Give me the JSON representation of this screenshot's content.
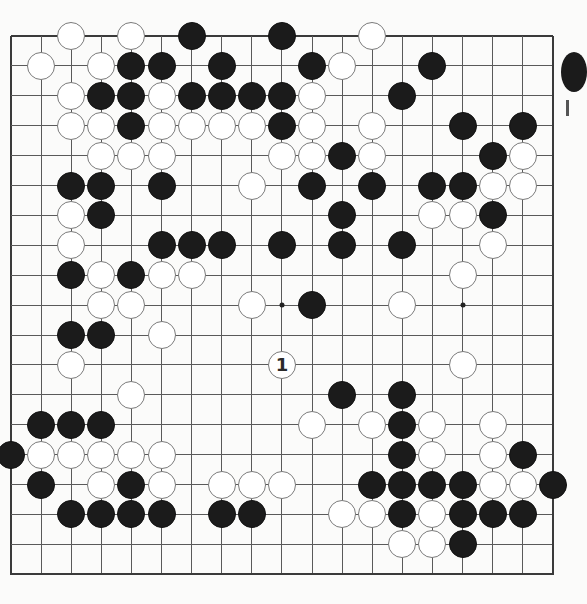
{
  "board": {
    "size": 19,
    "origin_x": 11,
    "origin_y": 36,
    "step_x": 30.1,
    "step_y": 29.9,
    "colors": {
      "background": "#fbfbfa",
      "grid_line": "#5a5a5a",
      "edge_line": "#3a3a3a",
      "black_stone": "#1b1b1b",
      "white_stone": "#ffffff",
      "white_outline": "#7a7a7a"
    },
    "star_points": [
      {
        "col": 9,
        "row": 9
      },
      {
        "col": 15,
        "row": 9
      }
    ],
    "stones": [
      {
        "col": 2,
        "row": 0,
        "color": "white"
      },
      {
        "col": 4,
        "row": 0,
        "color": "white"
      },
      {
        "col": 6,
        "row": 0,
        "color": "black"
      },
      {
        "col": 9,
        "row": 0,
        "color": "black"
      },
      {
        "col": 12,
        "row": 0,
        "color": "white"
      },
      {
        "col": 1,
        "row": 1,
        "color": "white"
      },
      {
        "col": 3,
        "row": 1,
        "color": "white"
      },
      {
        "col": 4,
        "row": 1,
        "color": "black"
      },
      {
        "col": 5,
        "row": 1,
        "color": "black"
      },
      {
        "col": 7,
        "row": 1,
        "color": "black"
      },
      {
        "col": 10,
        "row": 1,
        "color": "black"
      },
      {
        "col": 11,
        "row": 1,
        "color": "white"
      },
      {
        "col": 14,
        "row": 1,
        "color": "black"
      },
      {
        "col": 2,
        "row": 2,
        "color": "white"
      },
      {
        "col": 3,
        "row": 2,
        "color": "black"
      },
      {
        "col": 4,
        "row": 2,
        "color": "black"
      },
      {
        "col": 5,
        "row": 2,
        "color": "white"
      },
      {
        "col": 6,
        "row": 2,
        "color": "black"
      },
      {
        "col": 7,
        "row": 2,
        "color": "black"
      },
      {
        "col": 8,
        "row": 2,
        "color": "black"
      },
      {
        "col": 9,
        "row": 2,
        "color": "black"
      },
      {
        "col": 10,
        "row": 2,
        "color": "white"
      },
      {
        "col": 13,
        "row": 2,
        "color": "black"
      },
      {
        "col": 2,
        "row": 3,
        "color": "white"
      },
      {
        "col": 3,
        "row": 3,
        "color": "white"
      },
      {
        "col": 4,
        "row": 3,
        "color": "black"
      },
      {
        "col": 5,
        "row": 3,
        "color": "white"
      },
      {
        "col": 6,
        "row": 3,
        "color": "white"
      },
      {
        "col": 7,
        "row": 3,
        "color": "white"
      },
      {
        "col": 8,
        "row": 3,
        "color": "white"
      },
      {
        "col": 9,
        "row": 3,
        "color": "black"
      },
      {
        "col": 10,
        "row": 3,
        "color": "white"
      },
      {
        "col": 12,
        "row": 3,
        "color": "white"
      },
      {
        "col": 15,
        "row": 3,
        "color": "black"
      },
      {
        "col": 17,
        "row": 3,
        "color": "black"
      },
      {
        "col": 3,
        "row": 4,
        "color": "white"
      },
      {
        "col": 4,
        "row": 4,
        "color": "white"
      },
      {
        "col": 5,
        "row": 4,
        "color": "white"
      },
      {
        "col": 9,
        "row": 4,
        "color": "white"
      },
      {
        "col": 10,
        "row": 4,
        "color": "white"
      },
      {
        "col": 11,
        "row": 4,
        "color": "black"
      },
      {
        "col": 12,
        "row": 4,
        "color": "white"
      },
      {
        "col": 16,
        "row": 4,
        "color": "black"
      },
      {
        "col": 17,
        "row": 4,
        "color": "white"
      },
      {
        "col": 2,
        "row": 5,
        "color": "black"
      },
      {
        "col": 3,
        "row": 5,
        "color": "black"
      },
      {
        "col": 5,
        "row": 5,
        "color": "black"
      },
      {
        "col": 8,
        "row": 5,
        "color": "white"
      },
      {
        "col": 10,
        "row": 5,
        "color": "black"
      },
      {
        "col": 12,
        "row": 5,
        "color": "black"
      },
      {
        "col": 14,
        "row": 5,
        "color": "black"
      },
      {
        "col": 15,
        "row": 5,
        "color": "black"
      },
      {
        "col": 16,
        "row": 5,
        "color": "white"
      },
      {
        "col": 17,
        "row": 5,
        "color": "white"
      },
      {
        "col": 2,
        "row": 6,
        "color": "white"
      },
      {
        "col": 3,
        "row": 6,
        "color": "black"
      },
      {
        "col": 11,
        "row": 6,
        "color": "black"
      },
      {
        "col": 14,
        "row": 6,
        "color": "white"
      },
      {
        "col": 15,
        "row": 6,
        "color": "white"
      },
      {
        "col": 16,
        "row": 6,
        "color": "black"
      },
      {
        "col": 2,
        "row": 7,
        "color": "white"
      },
      {
        "col": 5,
        "row": 7,
        "color": "black"
      },
      {
        "col": 6,
        "row": 7,
        "color": "black"
      },
      {
        "col": 7,
        "row": 7,
        "color": "black"
      },
      {
        "col": 9,
        "row": 7,
        "color": "black"
      },
      {
        "col": 11,
        "row": 7,
        "color": "black"
      },
      {
        "col": 13,
        "row": 7,
        "color": "black"
      },
      {
        "col": 16,
        "row": 7,
        "color": "white"
      },
      {
        "col": 2,
        "row": 8,
        "color": "black"
      },
      {
        "col": 3,
        "row": 8,
        "color": "white"
      },
      {
        "col": 4,
        "row": 8,
        "color": "black"
      },
      {
        "col": 5,
        "row": 8,
        "color": "white"
      },
      {
        "col": 6,
        "row": 8,
        "color": "white"
      },
      {
        "col": 15,
        "row": 8,
        "color": "white"
      },
      {
        "col": 3,
        "row": 9,
        "color": "white"
      },
      {
        "col": 4,
        "row": 9,
        "color": "white"
      },
      {
        "col": 8,
        "row": 9,
        "color": "white"
      },
      {
        "col": 10,
        "row": 9,
        "color": "black"
      },
      {
        "col": 13,
        "row": 9,
        "color": "white"
      },
      {
        "col": 2,
        "row": 10,
        "color": "black"
      },
      {
        "col": 3,
        "row": 10,
        "color": "black"
      },
      {
        "col": 5,
        "row": 10,
        "color": "white"
      },
      {
        "col": 2,
        "row": 11,
        "color": "white"
      },
      {
        "col": 9,
        "row": 11,
        "color": "white",
        "label": "1"
      },
      {
        "col": 15,
        "row": 11,
        "color": "white"
      },
      {
        "col": 4,
        "row": 12,
        "color": "white"
      },
      {
        "col": 11,
        "row": 12,
        "color": "black"
      },
      {
        "col": 13,
        "row": 12,
        "color": "black"
      },
      {
        "col": 1,
        "row": 13,
        "color": "black"
      },
      {
        "col": 2,
        "row": 13,
        "color": "black"
      },
      {
        "col": 3,
        "row": 13,
        "color": "black"
      },
      {
        "col": 10,
        "row": 13,
        "color": "white"
      },
      {
        "col": 12,
        "row": 13,
        "color": "white"
      },
      {
        "col": 13,
        "row": 13,
        "color": "black"
      },
      {
        "col": 14,
        "row": 13,
        "color": "white"
      },
      {
        "col": 16,
        "row": 13,
        "color": "white"
      },
      {
        "col": 0,
        "row": 14,
        "color": "black"
      },
      {
        "col": 1,
        "row": 14,
        "color": "white"
      },
      {
        "col": 2,
        "row": 14,
        "color": "white"
      },
      {
        "col": 3,
        "row": 14,
        "color": "white"
      },
      {
        "col": 4,
        "row": 14,
        "color": "white"
      },
      {
        "col": 5,
        "row": 14,
        "color": "white"
      },
      {
        "col": 13,
        "row": 14,
        "color": "black"
      },
      {
        "col": 14,
        "row": 14,
        "color": "white"
      },
      {
        "col": 16,
        "row": 14,
        "color": "white"
      },
      {
        "col": 17,
        "row": 14,
        "color": "black"
      },
      {
        "col": 1,
        "row": 15,
        "color": "black"
      },
      {
        "col": 3,
        "row": 15,
        "color": "white"
      },
      {
        "col": 4,
        "row": 15,
        "color": "black"
      },
      {
        "col": 5,
        "row": 15,
        "color": "white"
      },
      {
        "col": 7,
        "row": 15,
        "color": "white"
      },
      {
        "col": 8,
        "row": 15,
        "color": "white"
      },
      {
        "col": 9,
        "row": 15,
        "color": "white"
      },
      {
        "col": 12,
        "row": 15,
        "color": "black"
      },
      {
        "col": 13,
        "row": 15,
        "color": "black"
      },
      {
        "col": 14,
        "row": 15,
        "color": "black"
      },
      {
        "col": 15,
        "row": 15,
        "color": "black"
      },
      {
        "col": 16,
        "row": 15,
        "color": "white"
      },
      {
        "col": 17,
        "row": 15,
        "color": "white"
      },
      {
        "col": 18,
        "row": 15,
        "color": "black"
      },
      {
        "col": 2,
        "row": 16,
        "color": "black"
      },
      {
        "col": 3,
        "row": 16,
        "color": "black"
      },
      {
        "col": 4,
        "row": 16,
        "color": "black"
      },
      {
        "col": 5,
        "row": 16,
        "color": "black"
      },
      {
        "col": 7,
        "row": 16,
        "color": "black"
      },
      {
        "col": 8,
        "row": 16,
        "color": "black"
      },
      {
        "col": 11,
        "row": 16,
        "color": "white"
      },
      {
        "col": 12,
        "row": 16,
        "color": "white"
      },
      {
        "col": 13,
        "row": 16,
        "color": "black"
      },
      {
        "col": 14,
        "row": 16,
        "color": "white"
      },
      {
        "col": 15,
        "row": 16,
        "color": "black"
      },
      {
        "col": 16,
        "row": 16,
        "color": "black"
      },
      {
        "col": 17,
        "row": 16,
        "color": "black"
      },
      {
        "col": 13,
        "row": 17,
        "color": "white"
      },
      {
        "col": 14,
        "row": 17,
        "color": "white"
      },
      {
        "col": 15,
        "row": 17,
        "color": "black"
      }
    ]
  },
  "move_marker": {
    "label": "1",
    "col": 9,
    "row": 11,
    "color": "white"
  }
}
